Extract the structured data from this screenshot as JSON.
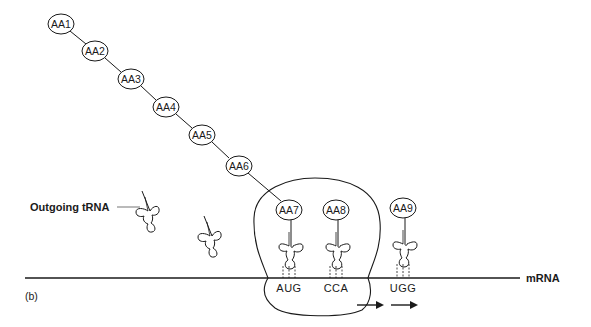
{
  "figure": {
    "panel_label": "(b)",
    "labels": {
      "outgoing_trna": "Outgoing tRNA",
      "mrna": "mRNA"
    },
    "amino_acids": [
      {
        "label": "AA1"
      },
      {
        "label": "AA2"
      },
      {
        "label": "AA3"
      },
      {
        "label": "AA4"
      },
      {
        "label": "AA5"
      },
      {
        "label": "AA6"
      },
      {
        "label": "AA7"
      },
      {
        "label": "AA8"
      },
      {
        "label": "AA9"
      }
    ],
    "codons": [
      {
        "label": "AUG"
      },
      {
        "label": "CCA"
      },
      {
        "label": "UGG"
      }
    ],
    "arrows": [
      {
        "direction": "right"
      },
      {
        "direction": "right"
      }
    ],
    "colors": {
      "ink": "#1a1a1a",
      "background": "#ffffff"
    }
  }
}
